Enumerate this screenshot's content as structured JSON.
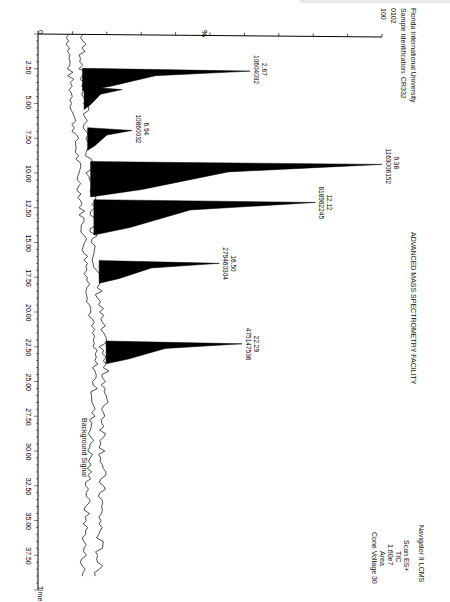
{
  "header": {
    "institution": "Florida International University",
    "sample_id": "Sample Identification: CR332",
    "run_code": "0102",
    "facility": "ADVANCED MASS SPECTROMETRY FACILITY"
  },
  "instrument": {
    "name": "Navigator II LCMS",
    "scan": "Scan ES+",
    "trace": "TIC",
    "max_intensity": "1.60e7",
    "mode": "Area",
    "cone_voltage": "Cone Voltage 30"
  },
  "annotations": {
    "background": "Background Signal",
    "y_marker": "%"
  },
  "chart_data": {
    "type": "line",
    "title": "ADVANCED MASS SPECTROMETRY FACILITY",
    "subtitle": "Sample Identification: CR332",
    "xlabel": "Time",
    "ylabel": "%",
    "xlim": [
      0,
      40
    ],
    "ylim": [
      0,
      100
    ],
    "x_ticks": [
      "2.50",
      "5.00",
      "7.50",
      "10.00",
      "12.50",
      "15.00",
      "17.50",
      "20.00",
      "22.50",
      "25.00",
      "27.50",
      "30.00",
      "32.50",
      "35.00",
      "37.50"
    ],
    "y_ticks": [
      "0",
      "100"
    ],
    "grid": false,
    "orientation": "rotated 90 degrees clockwise",
    "series": [
      {
        "name": "TIC (Scan ES+)",
        "fill": "black"
      },
      {
        "name": "Background Signal",
        "fill": "none"
      }
    ],
    "peaks": [
      {
        "rt": 2.67,
        "area": "10604032",
        "rel_height": 53
      },
      {
        "rt": 4.0,
        "area": "",
        "rel_height": 12
      },
      {
        "rt": 6.94,
        "area": "10860032",
        "rel_height": 14
      },
      {
        "rt": 9.38,
        "area": "1163006152",
        "rel_height": 100
      },
      {
        "rt": 12.12,
        "area": "818982245",
        "rel_height": 70
      },
      {
        "rt": 16.5,
        "area": "279460304",
        "rel_height": 38
      },
      {
        "rt": 22.29,
        "area": "475147536",
        "rel_height": 43
      }
    ]
  }
}
